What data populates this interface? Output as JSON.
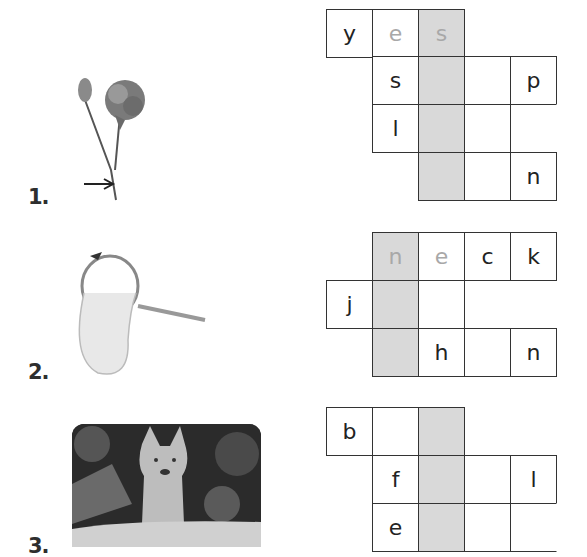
{
  "exercises": [
    {
      "number": "1.",
      "image": "carnation-flower-with-arrow-pointing-to-stem",
      "grid": {
        "rows": [
          [
            {
              "col": 0,
              "letter": "y"
            },
            {
              "col": 1,
              "letter": "e",
              "hint": true
            },
            {
              "col": 2,
              "letter": "s",
              "hint": true,
              "shaded": true
            }
          ],
          [
            {
              "col": 1,
              "letter": "s"
            },
            {
              "col": 2,
              "letter": "",
              "shaded": true
            },
            {
              "col": 3,
              "letter": ""
            },
            {
              "col": 4,
              "letter": "p"
            }
          ],
          [
            {
              "col": 1,
              "letter": "l"
            },
            {
              "col": 2,
              "letter": "",
              "shaded": true
            },
            {
              "col": 3,
              "letter": ""
            },
            {
              "col": 4,
              "letter": "",
              "noright": true
            }
          ],
          [
            {
              "col": 2,
              "letter": "",
              "shaded": true
            },
            {
              "col": 3,
              "letter": ""
            },
            {
              "col": 4,
              "letter": "n"
            }
          ]
        ]
      }
    },
    {
      "number": "2.",
      "image": "butterfly-net",
      "grid": {
        "rows": [
          [
            {
              "col": 1,
              "letter": "n",
              "hint": true,
              "shaded": true
            },
            {
              "col": 2,
              "letter": "e",
              "hint": true
            },
            {
              "col": 3,
              "letter": "c"
            },
            {
              "col": 4,
              "letter": "k"
            }
          ],
          [
            {
              "col": 0,
              "letter": "j"
            },
            {
              "col": 1,
              "letter": "",
              "shaded": true
            },
            {
              "col": 2,
              "letter": ""
            }
          ],
          [
            {
              "col": 1,
              "letter": "",
              "shaded": true
            },
            {
              "col": 2,
              "letter": "h"
            },
            {
              "col": 3,
              "letter": ""
            },
            {
              "col": 4,
              "letter": "n"
            }
          ]
        ]
      }
    },
    {
      "number": "3.",
      "image": "fox-at-den",
      "grid": {
        "rows": [
          [
            {
              "col": 0,
              "letter": "b"
            },
            {
              "col": 1,
              "letter": ""
            },
            {
              "col": 2,
              "letter": "",
              "shaded": true
            }
          ],
          [
            {
              "col": 1,
              "letter": "f"
            },
            {
              "col": 2,
              "letter": "",
              "shaded": true
            },
            {
              "col": 3,
              "letter": ""
            },
            {
              "col": 4,
              "letter": "l"
            }
          ],
          [
            {
              "col": 1,
              "letter": "e"
            },
            {
              "col": 2,
              "letter": "",
              "shaded": true
            },
            {
              "col": 3,
              "letter": ""
            },
            {
              "col": 4,
              "letter": "",
              "noright": true
            }
          ]
        ]
      }
    }
  ],
  "colors": {
    "shaded_column": "#d9d9d9",
    "hint_letter": "#a8a8a8",
    "grid_border": "#333333"
  }
}
